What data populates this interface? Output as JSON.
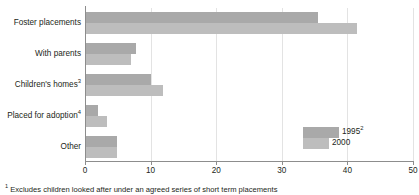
{
  "chart_data": {
    "type": "bar",
    "orientation": "horizontal",
    "title": "",
    "subtitle": "",
    "xlabel": "",
    "ylabel": "",
    "xlim": [
      0,
      50
    ],
    "xticks": [
      0,
      10,
      20,
      30,
      40,
      50
    ],
    "xtick_labels": [
      "0",
      "10",
      "20",
      "30",
      "40",
      "50"
    ],
    "grid": true,
    "grid_axis": "x",
    "legend_position": "inside-bottom-right",
    "categories": [
      "Foster placements",
      "Children's homes",
      "With parents",
      "Placed for adoption",
      "Other"
    ],
    "category_labels": [
      {
        "text": "Foster placements",
        "sup": ""
      },
      {
        "text": "With parents",
        "sup": ""
      },
      {
        "text": "Children's homes",
        "sup": "3"
      },
      {
        "text": "Placed for adoption",
        "sup": "4"
      },
      {
        "text": "Other",
        "sup": ""
      }
    ],
    "series": [
      {
        "name": "1995",
        "name_sup": "2",
        "color": "#a9a9a9",
        "values": [
          35.5,
          10.0,
          7.8,
          2.0,
          4.9
        ]
      },
      {
        "name": "2000",
        "name_sup": "",
        "color": "#bdbdbd",
        "values": [
          41.5,
          11.9,
          7.0,
          3.3,
          4.9
        ]
      }
    ],
    "category_order": [
      "Foster placements",
      "With parents",
      "Children's homes",
      "Placed for adoption",
      "Other"
    ]
  },
  "legend": {
    "items": [
      {
        "label": "1995",
        "sup": "2",
        "color": "#a9a9a9"
      },
      {
        "label": "2000",
        "sup": "",
        "color": "#bdbdbd"
      }
    ]
  },
  "footnote": {
    "marker": "1",
    "text": "Excludes children looked after under an agreed series of short term placements"
  },
  "colors": {
    "series_1995": "#a9a9a9",
    "series_2000": "#bdbdbd",
    "axis": "#8d8d8d",
    "gridline": "#e3e3e3",
    "text": "#231f20",
    "background": "#ffffff"
  }
}
